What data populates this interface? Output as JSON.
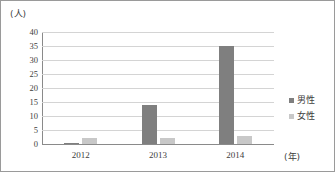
{
  "chart_data": {
    "type": "bar",
    "title": "",
    "subtitle": "",
    "xlabel": "(年)",
    "ylabel": "(人)",
    "categories": [
      "2012",
      "2013",
      "2014"
    ],
    "series": [
      {
        "name": "男性",
        "values": [
          0.5,
          14,
          35
        ],
        "color": "#7f7f7f"
      },
      {
        "name": "女性",
        "values": [
          2,
          2,
          3
        ],
        "color": "#c8c8c8"
      }
    ],
    "ylim": [
      0,
      40
    ],
    "yticks": [
      0,
      5,
      10,
      15,
      20,
      25,
      30,
      35,
      40
    ],
    "ytick_labels": [
      "0",
      "5",
      "10",
      "15",
      "20",
      "25",
      "30",
      "35",
      "40"
    ],
    "grid": true,
    "grid_axis": "y",
    "legend_position": "right",
    "legend": [
      "男性",
      "女性"
    ],
    "bar_colors": {
      "male": "#7f7f7f",
      "female": "#c8c8c8"
    },
    "frame_color": "#9a9a9a",
    "gridline_color": "#d4d4d4",
    "axis_color": "#8a8a8a"
  }
}
